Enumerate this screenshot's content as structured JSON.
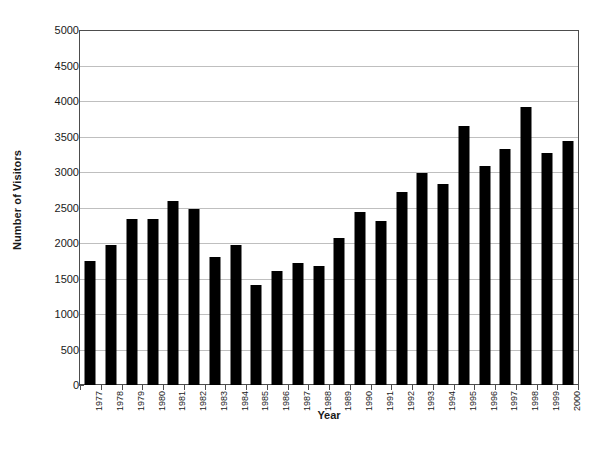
{
  "chart_data": {
    "type": "bar",
    "title": "",
    "xlabel": "Year",
    "ylabel": "Number of Visitors",
    "ylim": [
      0,
      5000
    ],
    "ytick_step": 500,
    "yticks": [
      0,
      500,
      1000,
      1500,
      2000,
      2500,
      3000,
      3500,
      4000,
      4500,
      5000
    ],
    "ytick_labels": [
      "0",
      "500",
      "1000",
      "1500",
      "2000",
      "2500",
      "3000",
      "3500",
      "4000",
      "4500",
      "5000"
    ],
    "grid": true,
    "grid_axis": "y",
    "legend": false,
    "bar_color": "#000000",
    "categories": [
      "1977",
      "1978",
      "1979",
      "1980",
      "1981",
      "1982",
      "1983",
      "1984",
      "1985",
      "1986",
      "1987",
      "1988",
      "1989",
      "1990",
      "1991",
      "1992",
      "1993",
      "1994",
      "1995",
      "1996",
      "1997",
      "1998",
      "1999",
      "2000"
    ],
    "values": [
      1750,
      1980,
      2340,
      2340,
      2600,
      2480,
      1810,
      1980,
      1410,
      1610,
      1730,
      1680,
      2080,
      2440,
      2320,
      2720,
      2990,
      2840,
      3660,
      3090,
      3340,
      3920,
      3270,
      3440
    ]
  },
  "axes": {
    "y_title": "Number of Visitors",
    "x_title": "Year"
  }
}
